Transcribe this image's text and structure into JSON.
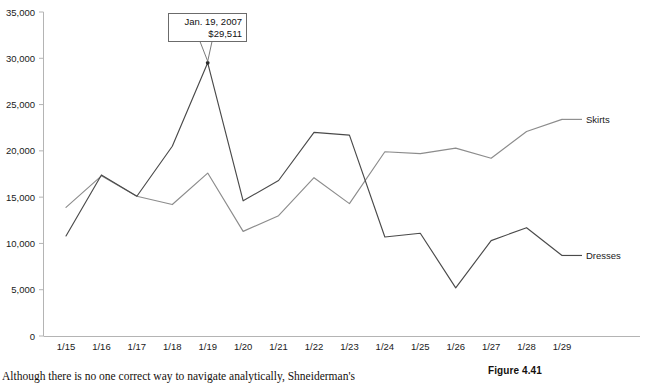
{
  "figure": {
    "caption": "Figure 4.41",
    "body_text": "Although there is no one correct way to navigate analytically, Shneiderman's"
  },
  "annotation": {
    "line1": "Jan. 19, 2007",
    "line2": "$29,511",
    "point_date": "1/19",
    "point_value": 29511
  },
  "colors": {
    "dresses_line": "#4a4a4a",
    "skirts_line": "#8c8c8c",
    "axis": "#b4b4b4",
    "annotation_border": "#6b6b6b",
    "text": "#1a1a1a",
    "background": "#ffffff"
  },
  "chart_data": {
    "type": "line",
    "title": "",
    "xlabel": "",
    "ylabel": "",
    "ylim": [
      0,
      35000
    ],
    "ytick_labels": [
      "35,000",
      "30,000",
      "25,000",
      "20,000",
      "15,000",
      "10,000",
      "5,000",
      "0"
    ],
    "yticks": [
      35000,
      30000,
      25000,
      20000,
      15000,
      10000,
      5000,
      0
    ],
    "grid": false,
    "legend": "right-inline-labels",
    "categories": [
      "1/15",
      "1/16",
      "1/17",
      "1/18",
      "1/19",
      "1/20",
      "1/21",
      "1/22",
      "1/23",
      "1/24",
      "1/25",
      "1/26",
      "1/27",
      "1/28",
      "1/29"
    ],
    "series": [
      {
        "name": "Skirts",
        "color": "#8c8c8c",
        "values": [
          13900,
          17300,
          15100,
          14200,
          17600,
          11300,
          13000,
          17100,
          14300,
          19900,
          19700,
          20300,
          19200,
          22100,
          23400
        ]
      },
      {
        "name": "Dresses",
        "color": "#4a4a4a",
        "values": [
          10800,
          17400,
          15100,
          20500,
          29511,
          14600,
          16800,
          22000,
          21700,
          10700,
          11100,
          5200,
          10300,
          11700,
          8700
        ]
      }
    ]
  }
}
